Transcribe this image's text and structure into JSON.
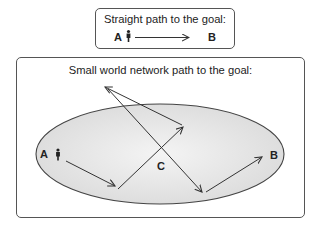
{
  "straight_path": {
    "title": "Straight path to the goal:",
    "start_label": "A",
    "end_label": "B"
  },
  "small_world": {
    "title": "Small world network path to the goal:",
    "start_label": "A",
    "hub_label": "C",
    "end_label": "B",
    "region_fill": "#e8e8e8"
  },
  "colors": {
    "stroke": "#333333",
    "text": "#222222"
  }
}
